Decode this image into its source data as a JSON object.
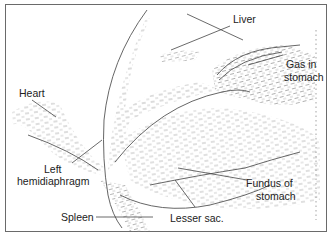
{
  "diagram": {
    "type": "anatomical-ultrasound-line-drawing",
    "labels": {
      "liver": "Liver",
      "gas_in_stomach_1": "Gas  in",
      "gas_in_stomach_2": "stomach",
      "heart": "Heart",
      "left_hemidiaphragm_1": "Left",
      "left_hemidiaphragm_2": "hemidiaphragm",
      "fundus_1": "Fundus of",
      "fundus_2": "stomach",
      "spleen": "Spleen",
      "lesser_sac": "Lesser sac."
    },
    "colors": {
      "line": "#555555",
      "stipple": "#8a8a8a",
      "text": "#222222",
      "background": "#ffffff"
    }
  }
}
